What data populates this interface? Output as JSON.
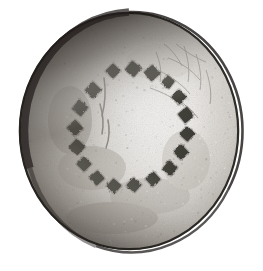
{
  "image": {
    "kind": "natural-image",
    "subject": "circular-artifact-disc",
    "description": "Black and white photograph of a round disc-shaped artifact with a ring of punched square marks",
    "background_color": "#ffffff",
    "width": 263,
    "height": 271
  },
  "disc": {
    "center_x": 129,
    "center_y": 131,
    "radius_x": 110,
    "radius_y": 119,
    "surface_color": "#d8d5d0",
    "highlight_color": "#f2f0ec",
    "midtone_color": "#b9b5ae",
    "shadow_color": "#6d6963",
    "rim_dark_color": "#2b2724",
    "edge_line_color": "#1d1a18"
  },
  "marks": {
    "count": 18,
    "shape": "square",
    "fill_color": "#33302c",
    "ring_radius_x": 58,
    "ring_radius_y": 58,
    "ring_center_x": 130,
    "ring_center_y": 128,
    "size": 11,
    "items": [
      {
        "index": 1,
        "x": 113,
        "y": 71,
        "size": 11,
        "rotation": 45
      },
      {
        "index": 2,
        "x": 133,
        "y": 69,
        "size": 12,
        "rotation": 40
      },
      {
        "index": 3,
        "x": 152,
        "y": 73,
        "size": 12,
        "rotation": 48
      },
      {
        "index": 4,
        "x": 168,
        "y": 82,
        "size": 10,
        "rotation": 38
      },
      {
        "index": 5,
        "x": 179,
        "y": 97,
        "size": 11,
        "rotation": 44
      },
      {
        "index": 6,
        "x": 186,
        "y": 115,
        "size": 12,
        "rotation": 50
      },
      {
        "index": 7,
        "x": 187,
        "y": 134,
        "size": 11,
        "rotation": 42
      },
      {
        "index": 8,
        "x": 181,
        "y": 152,
        "size": 11,
        "rotation": 46
      },
      {
        "index": 9,
        "x": 170,
        "y": 168,
        "size": 11,
        "rotation": 39
      },
      {
        "index": 10,
        "x": 153,
        "y": 179,
        "size": 11,
        "rotation": 47
      },
      {
        "index": 11,
        "x": 134,
        "y": 185,
        "size": 11,
        "rotation": 43
      },
      {
        "index": 12,
        "x": 114,
        "y": 186,
        "size": 11,
        "rotation": 41
      },
      {
        "index": 13,
        "x": 97,
        "y": 178,
        "size": 11,
        "rotation": 49
      },
      {
        "index": 14,
        "x": 84,
        "y": 164,
        "size": 11,
        "rotation": 45
      },
      {
        "index": 15,
        "x": 77,
        "y": 147,
        "size": 12,
        "rotation": 43
      },
      {
        "index": 16,
        "x": 75,
        "y": 128,
        "size": 12,
        "rotation": 46
      },
      {
        "index": 17,
        "x": 80,
        "y": 108,
        "size": 12,
        "rotation": 40
      },
      {
        "index": 18,
        "x": 93,
        "y": 90,
        "size": 12,
        "rotation": 44
      }
    ]
  },
  "cracks": {
    "color": "#8a857e",
    "region": "upper-right",
    "paths": [
      "M176,44 C186,52 196,58 206,62",
      "M168,58 C180,62 192,70 200,80",
      "M158,70 C170,76 182,84 190,94",
      "M184,46 C188,58 190,70 188,82",
      "M196,54 C200,66 202,78 200,90",
      "M164,44 C172,50 178,58 182,66",
      "M150,88 C162,92 174,98 184,106",
      "M206,70 C210,82 212,94 210,104",
      "M172,96 C182,102 192,110 198,118",
      "M156,52 C160,62 162,72 160,82"
    ]
  },
  "surface_marks": {
    "color": "#6f6a64",
    "scratch_paths": [
      "M104,78 C106,90 105,104 102,116",
      "M100,104 C103,114 104,124 102,134",
      "M108,120 C110,130 109,140 106,148"
    ]
  },
  "grain": {
    "speckle_count": 460,
    "light_color": "#ffffff",
    "dark_color": "#76716b"
  }
}
